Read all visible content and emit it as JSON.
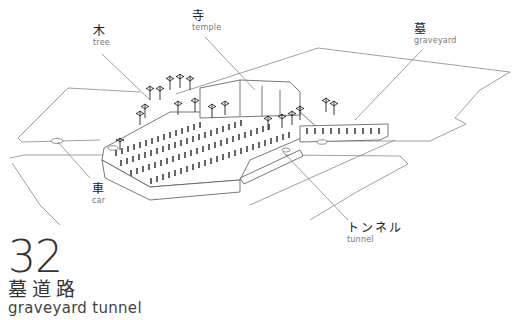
{
  "diagram": {
    "number": "32",
    "title_jp": "墓道路",
    "title_en": "graveyard tunnel",
    "colors": {
      "line": "#555555",
      "leader": "#777777",
      "text": "#333333",
      "subtext": "#777777"
    }
  },
  "labels": {
    "tree": {
      "jp": "木",
      "en": "tree"
    },
    "temple": {
      "jp": "寺",
      "en": "temple"
    },
    "graveyard": {
      "jp": "墓",
      "en": "graveyard"
    },
    "car": {
      "jp": "車",
      "en": "car"
    },
    "tunnel": {
      "jp": "トンネル",
      "en": "tunnel"
    }
  }
}
